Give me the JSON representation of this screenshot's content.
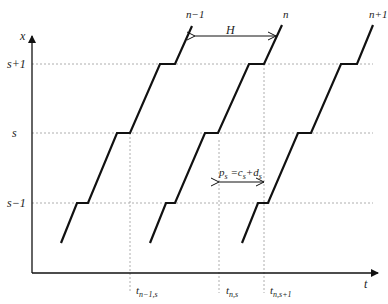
{
  "diagram": {
    "axes": {
      "x_label": "x",
      "t_label": "t"
    },
    "levels": [
      {
        "id": "s_plus_1",
        "label": "s+1",
        "y": 64
      },
      {
        "id": "s",
        "label": "s",
        "y": 133
      },
      {
        "id": "s_minus_1",
        "label": "s−1",
        "y": 203
      }
    ],
    "curves": [
      {
        "id": "n_minus_1",
        "label": "n−1"
      },
      {
        "id": "n",
        "label": "n"
      },
      {
        "id": "n_plus_1",
        "label": "n+1"
      }
    ],
    "headway": {
      "label": "H"
    },
    "process_time": {
      "label_p": "p",
      "label_sub_s": "s",
      "label_eq": " =",
      "label_c": "c",
      "label_plus": "+",
      "label_d": "d"
    },
    "time_marks": [
      {
        "id": "t_n_minus_1_s",
        "label": "t",
        "sub": "n−1,s"
      },
      {
        "id": "t_n_s",
        "label": "t",
        "sub": "n,s"
      },
      {
        "id": "t_n_s_plus_1",
        "label": "t",
        "sub": "n,s+1"
      }
    ]
  }
}
